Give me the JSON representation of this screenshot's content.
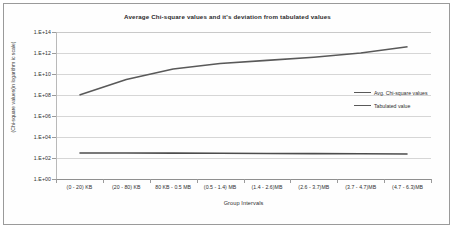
{
  "chart_data": {
    "type": "line",
    "title": "Average Chi-square values and it's deviation from tabulated values",
    "xlabel": "Group Intervals",
    "ylabel": "(Chi-square values(in logarithm ic scale)",
    "categories": [
      "(0 - 20) KB",
      "(20 - 80) KB",
      "80 KB - 0.5 MB",
      "(0.5 - 1.4) MB",
      "(1.4 - 2.6)MB",
      "(2.6 - 3.7)MB",
      "(3.7 - 4.7)MB",
      "(4.7 - 6.3)MB"
    ],
    "yscale": "log",
    "ylim": [
      1,
      100000000000000.0
    ],
    "ytick_labels": [
      "1.E+14",
      "1.E+12",
      "1.E+10",
      "1.E+08",
      "1.E+06",
      "1.E+04",
      "1.E+02",
      "1.E+00"
    ],
    "ytick_values": [
      100000000000000.0,
      1000000000000.0,
      10000000000.0,
      100000000.0,
      1000000.0,
      10000.0,
      100.0,
      1
    ],
    "grid": true,
    "legend_position": "right-middle",
    "series": [
      {
        "name": "Avg. Chi-square values",
        "color": "#595959",
        "values": [
          100000000.0,
          3000000000.0,
          30000000000.0,
          100000000000.0,
          200000000000.0,
          400000000000.0,
          1000000000000.0,
          4000000000000.0
        ]
      },
      {
        "name": "Tabulated value",
        "color": "#4d4d4d",
        "values": [
          300,
          300,
          290,
          280,
          270,
          260,
          250,
          240
        ]
      }
    ]
  },
  "legend": {
    "items": [
      {
        "label": "Avg. Chi-square values"
      },
      {
        "label": "Tabulated value"
      }
    ]
  }
}
